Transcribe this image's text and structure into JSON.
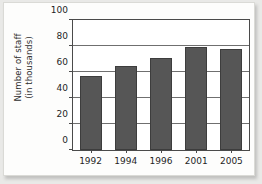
{
  "chart_data": {
    "type": "bar",
    "title": "",
    "xlabel": "",
    "ylabel": "Number of staff (in thousands)",
    "ylabel_lines": [
      "Number of staff",
      "(in thousands)"
    ],
    "categories": [
      "1992",
      "1994",
      "1996",
      "2001",
      "2005"
    ],
    "values": [
      57,
      65,
      71,
      79,
      78
    ],
    "ylim": [
      0,
      100
    ],
    "ytick_values": [
      0,
      20,
      40,
      60,
      80,
      100
    ],
    "ytick_labels": [
      "0",
      "20",
      "40",
      "60",
      "80",
      "100"
    ],
    "grid": true,
    "grid_axis": "y",
    "legend": false,
    "legend_position": "none",
    "series": [
      {
        "name": "Number of staff",
        "values": [
          57,
          65,
          71,
          79,
          78
        ]
      }
    ],
    "colors": {
      "bar_fill": "#565656",
      "bar_edge": "#3d3d3d",
      "grid": "#6f6f6f",
      "axis": "#4a4a4a",
      "plot_background": "#ffffff",
      "page_background": "#fdfdfc",
      "text": "#1f1f1f"
    }
  }
}
